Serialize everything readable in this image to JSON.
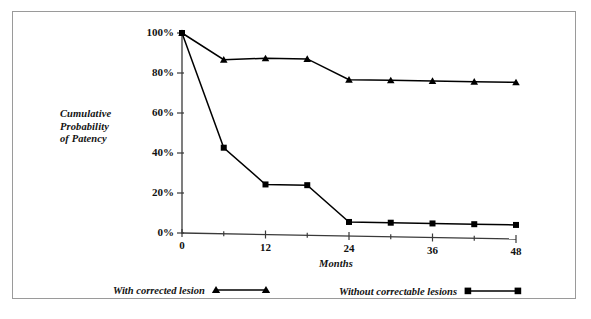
{
  "chart_data": {
    "type": "line",
    "title": "",
    "xlabel": "Months",
    "ylabel": "Cumulative Probability of Patency",
    "x": [
      0,
      6,
      12,
      18,
      24,
      30,
      36,
      42,
      48
    ],
    "xlim": [
      0,
      48
    ],
    "ylim": [
      0,
      100
    ],
    "grid": false,
    "legend_position": "bottom",
    "xtick_values": [
      0,
      12,
      24,
      36,
      48
    ],
    "xtick_labels": [
      "0",
      "12",
      "24",
      "36",
      "48"
    ],
    "xminor_ticks": [
      6,
      18,
      30,
      42
    ],
    "ytick_values": [
      0,
      20,
      40,
      60,
      80,
      100
    ],
    "ytick_labels": [
      "0%",
      "20%",
      "40%",
      "60%",
      "80%",
      "100%"
    ],
    "series": [
      {
        "name": "With corrected lesion",
        "marker": "triangle",
        "color": "#000000",
        "values": [
          100,
          87,
          88,
          88,
          78,
          78,
          78,
          78,
          78
        ]
      },
      {
        "name": "Without correctable lesions",
        "marker": "square",
        "color": "#000000",
        "values": [
          100,
          43,
          25,
          25,
          7,
          7,
          7,
          7,
          7
        ]
      }
    ]
  },
  "axes": {
    "y_title": "Cumulative\nProbability\nof Patency",
    "x_title": "Months"
  },
  "legend": {
    "items": [
      {
        "label": "With corrected lesion",
        "marker": "triangle"
      },
      {
        "label": "Without correctable lesions",
        "marker": "square"
      }
    ]
  }
}
